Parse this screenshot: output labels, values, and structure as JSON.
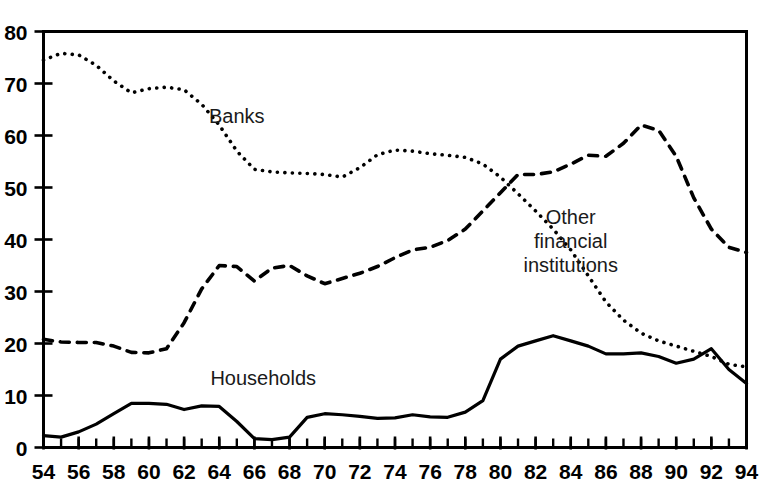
{
  "chart_data": {
    "type": "line",
    "title": "",
    "subtitle": "",
    "xlabel": "",
    "ylabel": "",
    "xlim": [
      54,
      94
    ],
    "ylim": [
      0,
      80
    ],
    "yticks": [
      0,
      10,
      20,
      30,
      40,
      50,
      60,
      70,
      80
    ],
    "ytick_labels": [
      "0",
      "10",
      "20",
      "30",
      "40",
      "50",
      "60",
      "70",
      "80"
    ],
    "xticks": [
      54,
      56,
      58,
      60,
      62,
      64,
      66,
      68,
      70,
      72,
      74,
      76,
      78,
      80,
      82,
      84,
      86,
      88,
      90,
      92,
      94
    ],
    "xtick_labels": [
      "54",
      "56",
      "58",
      "60",
      "62",
      "64",
      "66",
      "68",
      "70",
      "72",
      "74",
      "76",
      "78",
      "80",
      "82",
      "84",
      "86",
      "88",
      "90",
      "92",
      "94"
    ],
    "xtick_minor_step": 1,
    "grid": false,
    "legend": "inline-annotations",
    "x": [
      54,
      55,
      56,
      57,
      58,
      59,
      60,
      61,
      62,
      63,
      64,
      65,
      66,
      67,
      68,
      69,
      70,
      71,
      72,
      73,
      74,
      75,
      76,
      77,
      78,
      79,
      80,
      81,
      82,
      83,
      84,
      85,
      86,
      87,
      88,
      89,
      90,
      91,
      92,
      93,
      94
    ],
    "series": [
      {
        "name": "Banks",
        "style": "dotted",
        "label_x": 65.0,
        "label_y": 62.5,
        "values": [
          74.5,
          75.8,
          75.5,
          73.5,
          70.5,
          68.2,
          69.0,
          69.3,
          68.8,
          66.0,
          62.0,
          57.0,
          53.5,
          53.0,
          52.8,
          52.7,
          52.5,
          52.0,
          53.8,
          56.3,
          57.2,
          57.0,
          56.5,
          56.2,
          55.8,
          54.5,
          52.0,
          48.8,
          45.5,
          42.0,
          38.0,
          33.0,
          28.0,
          24.5,
          22.0,
          20.5,
          19.5,
          18.5,
          17.5,
          16.0,
          15.5
        ]
      },
      {
        "name": "Other financial institutions",
        "style": "dashed",
        "label_x": 84.0,
        "label_y": 43.0,
        "label_lines": [
          "Other",
          "financial",
          "institutions"
        ],
        "values": [
          20.8,
          20.3,
          20.2,
          20.2,
          19.5,
          18.3,
          18.2,
          19.0,
          24.0,
          30.5,
          35.0,
          34.8,
          32.0,
          34.5,
          35.0,
          33.0,
          31.5,
          32.5,
          33.5,
          34.8,
          36.5,
          38.0,
          38.5,
          39.8,
          42.0,
          45.5,
          49.0,
          52.5,
          52.5,
          53.0,
          54.5,
          56.2,
          56.0,
          58.5,
          62.0,
          61.0,
          56.0,
          48.0,
          42.0,
          38.5,
          37.5
        ]
      },
      {
        "name": "Households",
        "style": "solid",
        "label_x": 66.5,
        "label_y": 12.0,
        "values": [
          2.3,
          2.0,
          3.0,
          4.5,
          6.5,
          8.5,
          8.5,
          8.3,
          7.3,
          8.0,
          7.9,
          5.0,
          1.7,
          1.5,
          2.0,
          5.8,
          6.5,
          6.3,
          6.0,
          5.6,
          5.7,
          6.3,
          5.9,
          5.8,
          6.8,
          9.0,
          17.0,
          19.5,
          20.5,
          21.5,
          20.5,
          19.5,
          18.0,
          18.0,
          18.2,
          17.5,
          16.2,
          17.0,
          19.0,
          15.0,
          12.3
        ]
      }
    ],
    "series_value_x": {
      "Banks": [
        54,
        55,
        56,
        57,
        58,
        59,
        60,
        61,
        62,
        63,
        64,
        65,
        66,
        67,
        68,
        69,
        70,
        71,
        72,
        73,
        74,
        75,
        76,
        77,
        78,
        79,
        80,
        81,
        82,
        83,
        84,
        85,
        86,
        87,
        88,
        89,
        90,
        91,
        92,
        93,
        94
      ],
      "Other financial institutions": [
        54,
        55,
        56,
        57,
        58,
        59,
        60,
        61,
        62,
        63,
        64,
        65,
        66,
        67,
        68,
        69,
        70,
        71,
        72,
        73,
        74,
        75,
        76,
        77,
        78,
        79,
        80,
        81,
        82,
        83,
        84,
        85,
        86,
        87,
        88,
        89,
        90,
        91,
        92,
        93,
        94
      ],
      "Households": [
        54,
        55,
        56,
        57,
        58,
        59,
        60,
        61,
        62,
        63,
        64,
        65,
        66,
        67,
        68,
        69,
        70,
        71,
        72,
        73,
        74,
        75,
        76,
        77,
        78,
        79,
        80,
        81,
        82,
        83,
        84,
        85,
        86,
        87,
        88,
        89,
        90,
        91,
        92,
        93,
        94
      ]
    }
  },
  "annotations": {
    "banks": "Banks",
    "households": "Households",
    "other_line1": "Other",
    "other_line2": "financial",
    "other_line3": "institutions"
  },
  "colors": {
    "axis": "#000000",
    "series": "#000000",
    "background": "#ffffff"
  }
}
